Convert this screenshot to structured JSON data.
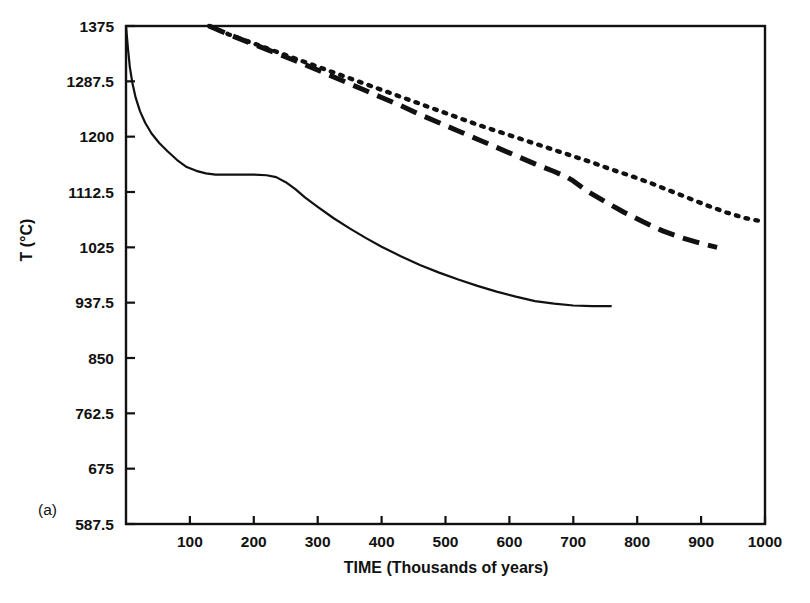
{
  "figure": {
    "panel_label": "(a)",
    "background_color": "#ffffff",
    "line_color": "#111111"
  },
  "chart_data": {
    "type": "line",
    "title": "",
    "subtitle": "",
    "xlabel": "TIME (Thousands of years)",
    "xlabel_main": "TIME",
    "xlabel_paren": "(Thousands of years)",
    "ylabel": "T (°C)",
    "xlim": [
      0,
      1000
    ],
    "ylim": [
      587.5,
      1375
    ],
    "xticks": [
      100,
      200,
      300,
      400,
      500,
      600,
      700,
      800,
      900,
      1000
    ],
    "xtick_labels": [
      "100",
      "200",
      "300",
      "400",
      "500",
      "600",
      "700",
      "800",
      "900",
      "1000"
    ],
    "yticks": [
      587.5,
      675,
      762.5,
      850,
      937.5,
      1025,
      1112.5,
      1200,
      1287.5,
      1375
    ],
    "ytick_labels": [
      "587.5",
      "675",
      "762.5",
      "850",
      "937.5",
      "1025",
      "1112.5",
      "1200",
      "1287.5",
      "1375"
    ],
    "grid": false,
    "legend": "none",
    "frame": "box",
    "series": [
      {
        "name": "solid-curve",
        "style": "solid",
        "color": "#111111",
        "points": [
          [
            0,
            1375
          ],
          [
            3,
            1340
          ],
          [
            6,
            1310
          ],
          [
            10,
            1285
          ],
          [
            15,
            1262
          ],
          [
            22,
            1240
          ],
          [
            30,
            1222
          ],
          [
            40,
            1205
          ],
          [
            52,
            1190
          ],
          [
            65,
            1177
          ],
          [
            80,
            1163
          ],
          [
            95,
            1152
          ],
          [
            110,
            1146
          ],
          [
            125,
            1142
          ],
          [
            140,
            1140
          ],
          [
            160,
            1140
          ],
          [
            180,
            1140
          ],
          [
            200,
            1140
          ],
          [
            220,
            1139
          ],
          [
            235,
            1136
          ],
          [
            250,
            1128
          ],
          [
            265,
            1117
          ],
          [
            280,
            1104
          ],
          [
            300,
            1089
          ],
          [
            325,
            1071
          ],
          [
            350,
            1055
          ],
          [
            375,
            1040
          ],
          [
            400,
            1026
          ],
          [
            430,
            1011
          ],
          [
            460,
            997
          ],
          [
            490,
            985
          ],
          [
            520,
            974
          ],
          [
            550,
            964
          ],
          [
            580,
            955
          ],
          [
            610,
            947
          ],
          [
            640,
            940
          ],
          [
            670,
            936
          ],
          [
            700,
            933
          ],
          [
            730,
            932
          ],
          [
            760,
            932
          ]
        ]
      },
      {
        "name": "dashed-curve",
        "style": "dashed",
        "color": "#111111",
        "points": [
          [
            130,
            1375
          ],
          [
            160,
            1362
          ],
          [
            190,
            1350
          ],
          [
            220,
            1338
          ],
          [
            250,
            1326
          ],
          [
            280,
            1314
          ],
          [
            310,
            1301
          ],
          [
            340,
            1288
          ],
          [
            370,
            1275
          ],
          [
            400,
            1262
          ],
          [
            430,
            1249
          ],
          [
            460,
            1235
          ],
          [
            490,
            1222
          ],
          [
            520,
            1209
          ],
          [
            550,
            1196
          ],
          [
            580,
            1183
          ],
          [
            610,
            1170
          ],
          [
            640,
            1157
          ],
          [
            670,
            1145
          ],
          [
            690,
            1136
          ],
          [
            700,
            1130
          ],
          [
            720,
            1115
          ],
          [
            750,
            1097
          ],
          [
            780,
            1080
          ],
          [
            810,
            1065
          ],
          [
            840,
            1051
          ],
          [
            870,
            1040
          ],
          [
            900,
            1031
          ],
          [
            925,
            1025
          ]
        ]
      },
      {
        "name": "dotted-curve",
        "style": "dotted",
        "color": "#111111",
        "points": [
          [
            130,
            1375
          ],
          [
            160,
            1362
          ],
          [
            190,
            1351
          ],
          [
            220,
            1340
          ],
          [
            250,
            1329
          ],
          [
            280,
            1318
          ],
          [
            310,
            1307
          ],
          [
            340,
            1296
          ],
          [
            370,
            1285
          ],
          [
            400,
            1274
          ],
          [
            430,
            1263
          ],
          [
            460,
            1252
          ],
          [
            490,
            1241
          ],
          [
            520,
            1230
          ],
          [
            550,
            1219
          ],
          [
            580,
            1209
          ],
          [
            610,
            1199
          ],
          [
            640,
            1189
          ],
          [
            670,
            1179
          ],
          [
            700,
            1169
          ],
          [
            730,
            1159
          ],
          [
            760,
            1148
          ],
          [
            790,
            1138
          ],
          [
            820,
            1127
          ],
          [
            850,
            1115
          ],
          [
            880,
            1103
          ],
          [
            910,
            1091
          ],
          [
            940,
            1080
          ],
          [
            970,
            1071
          ],
          [
            1000,
            1065
          ]
        ]
      }
    ]
  }
}
